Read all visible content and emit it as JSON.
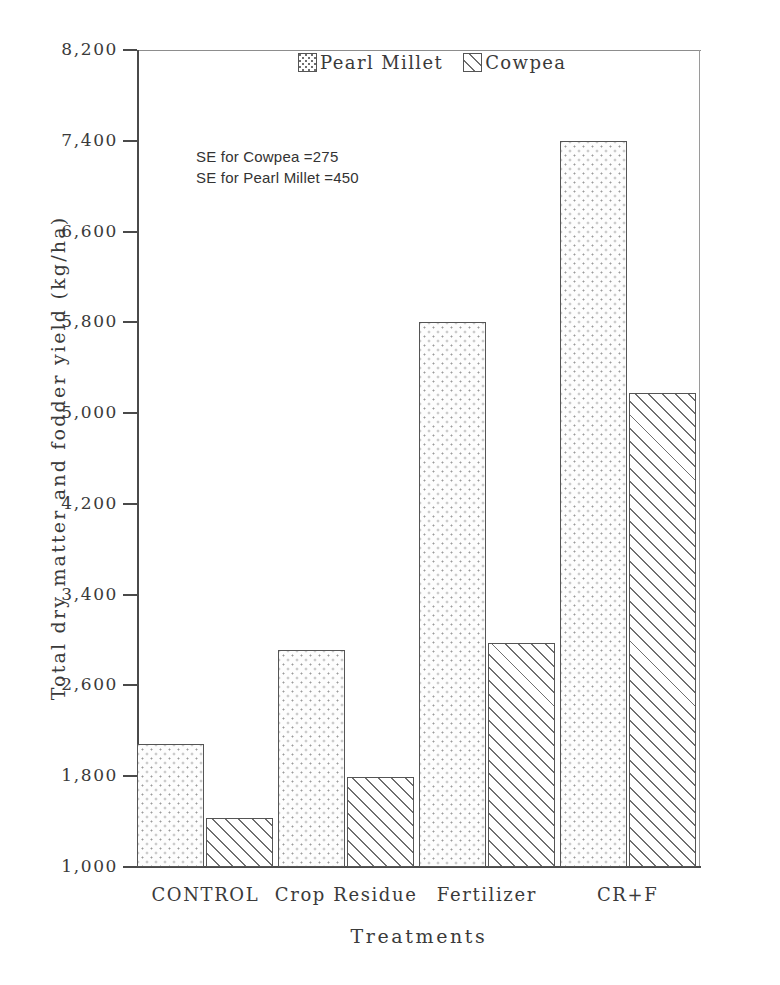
{
  "chart_data": {
    "type": "bar",
    "title": "",
    "xlabel": "Treatments",
    "ylabel": "Total dry matter and fodder yield (kg/ha)",
    "categories": [
      "CONTROL",
      "Crop Residue",
      "Fertilizer",
      "CR+F"
    ],
    "series": [
      {
        "name": "Pearl Millet",
        "values": [
          2080,
          2910,
          5800,
          7400
        ],
        "pattern": "dotted"
      },
      {
        "name": "Cowpea",
        "values": [
          1430,
          1790,
          2970,
          5180
        ],
        "pattern": "hatched"
      }
    ],
    "ylim": [
      1000,
      8200
    ],
    "yticks": [
      "1,000",
      "1,800",
      "2,600",
      "3,400",
      "4,200",
      "5,000",
      "5,800",
      "6,600",
      "7,400",
      "8,200"
    ],
    "ytick_values": [
      1000,
      1800,
      2600,
      3400,
      4200,
      5000,
      5800,
      6600,
      7400,
      8200
    ],
    "grid": false,
    "legend_position": "top-center",
    "legend": [
      "Pearl Millet",
      "Cowpea"
    ],
    "annotations": [
      "SE for Cowpea =275",
      "SE for Pearl Millet =450"
    ],
    "colors": {
      "axis": "#4a4a4a",
      "bar_outline": "#555555",
      "pattern": "#6f6f6f",
      "text": "#3a3a3a",
      "background": "#ffffff"
    }
  }
}
